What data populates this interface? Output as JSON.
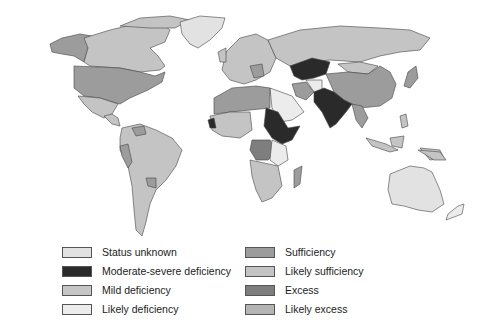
{
  "colors": {
    "status_unknown": "#e2e2e2",
    "moderate_severe_deficiency": "#2a2a2a",
    "mild_deficiency": "#c6c6c6",
    "likely_deficiency": "#ececec",
    "sufficiency": "#9c9c9c",
    "likely_sufficiency": "#c4c4c4",
    "excess": "#7e7e7e",
    "likely_excess": "#b4b4b4"
  },
  "legend": {
    "items": [
      {
        "label": "Status unknown",
        "color_key": "status_unknown"
      },
      {
        "label": "Moderate-severe deficiency",
        "color_key": "moderate_severe_deficiency"
      },
      {
        "label": "Mild deficiency",
        "color_key": "mild_deficiency"
      },
      {
        "label": "Likely deficiency",
        "color_key": "likely_deficiency"
      },
      {
        "label": "Sufficiency",
        "color_key": "sufficiency"
      },
      {
        "label": "Likely sufficiency",
        "color_key": "likely_sufficiency"
      },
      {
        "label": "Excess",
        "color_key": "excess"
      },
      {
        "label": "Likely excess",
        "color_key": "likely_excess"
      }
    ]
  },
  "map": {
    "type": "choropleth world map",
    "regions": [
      {
        "name": "Alaska",
        "category": "sufficiency"
      },
      {
        "name": "Canada",
        "category": "likely_sufficiency"
      },
      {
        "name": "Greenland",
        "category": "status_unknown"
      },
      {
        "name": "United States",
        "category": "sufficiency"
      },
      {
        "name": "Mexico",
        "category": "likely_sufficiency"
      },
      {
        "name": "Central America",
        "category": "likely_sufficiency"
      },
      {
        "name": "South America",
        "category": "likely_sufficiency"
      },
      {
        "name": "Europe",
        "category": "likely_sufficiency"
      },
      {
        "name": "Russia",
        "category": "likely_sufficiency"
      },
      {
        "name": "Central Asia",
        "category": "moderate_severe_deficiency"
      },
      {
        "name": "Pakistan / India",
        "category": "moderate_severe_deficiency"
      },
      {
        "name": "China",
        "category": "sufficiency"
      },
      {
        "name": "Mongolia",
        "category": "likely_sufficiency"
      },
      {
        "name": "Iran",
        "category": "sufficiency"
      },
      {
        "name": "Arabian Peninsula",
        "category": "likely_deficiency"
      },
      {
        "name": "North Africa",
        "category": "sufficiency"
      },
      {
        "name": "Sudan / Ethiopia",
        "category": "moderate_severe_deficiency"
      },
      {
        "name": "West Africa coast",
        "category": "moderate_severe_deficiency"
      },
      {
        "name": "Central Africa",
        "category": "excess"
      },
      {
        "name": "Southern Africa",
        "category": "likely_sufficiency"
      },
      {
        "name": "Madagascar",
        "category": "sufficiency"
      },
      {
        "name": "Southeast Asia",
        "category": "sufficiency"
      },
      {
        "name": "Japan",
        "category": "sufficiency"
      },
      {
        "name": "Indonesia",
        "category": "likely_sufficiency"
      },
      {
        "name": "Australia",
        "category": "status_unknown"
      },
      {
        "name": "New Zealand",
        "category": "likely_deficiency"
      }
    ]
  }
}
